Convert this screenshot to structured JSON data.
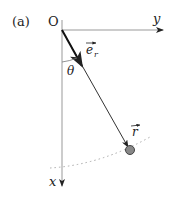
{
  "figure": {
    "panel_label": "(a)",
    "origin_label": "O",
    "y_axis_label": "y",
    "x_axis_label": "x",
    "unit_vector_label": "e",
    "unit_vector_subscript": "r",
    "angle_label": "θ",
    "position_vector_label": "r"
  },
  "colors": {
    "axis": "#9a9a9a",
    "rod": "#333333",
    "bob": "#777777",
    "trajectory": "#aaaaaa",
    "text": "#222222"
  }
}
